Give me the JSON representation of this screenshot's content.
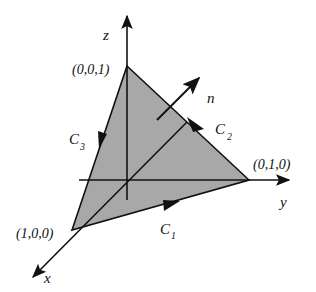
{
  "figure": {
    "fill_color": "#a8a8a8",
    "stroke_color": "#111111"
  },
  "axes": {
    "x": {
      "label": "x"
    },
    "y": {
      "label": "y"
    },
    "z": {
      "label": "z"
    }
  },
  "vertices": [
    {
      "name": "vertex-x",
      "label": "(1,0,0)"
    },
    {
      "name": "vertex-y",
      "label": "(0,1,0)"
    },
    {
      "name": "vertex-z",
      "label": "(0,0,1)"
    }
  ],
  "curves": [
    {
      "name": "C1",
      "base": "C",
      "subscript": "1"
    },
    {
      "name": "C2",
      "base": "C",
      "subscript": "2"
    },
    {
      "name": "C3",
      "base": "C",
      "subscript": "3"
    }
  ],
  "normal": {
    "label": "n"
  }
}
